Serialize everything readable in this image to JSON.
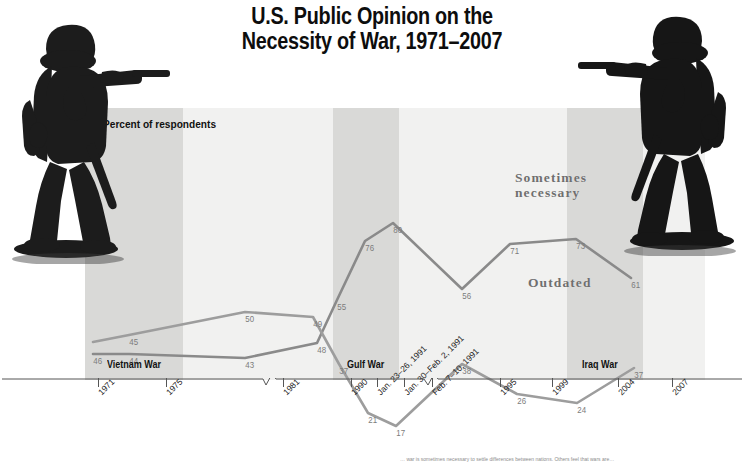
{
  "title": {
    "line1": "U.S. Public Opinion on the",
    "line2": "Necessity of War, 1971–2007"
  },
  "axis_label": "Percent of respondents",
  "war_bands": [
    {
      "name": "Vietnam War",
      "label": "Vietnam War"
    },
    {
      "name": "Gulf War",
      "label": "Gulf War"
    },
    {
      "name": "Iraq War",
      "label": "Iraq War"
    }
  ],
  "series_names": {
    "sometimes": "Sometimes\nnecessary",
    "sometimes_line1": "Sometimes",
    "sometimes_line2": "necessary",
    "outdated": "Outdated"
  },
  "caption": "… war is sometimes necessary to settle differences between nations. Others feel that wars are…",
  "colors": {
    "line_sometimes": "#8a8a8a",
    "line_outdated": "#9a9a9a",
    "band_light": "#f1f1f0",
    "band_dark": "#d9d9d7",
    "label_text": "#7c7c7c",
    "title": "#0d0d0d",
    "soldier": "#1b1b1b"
  },
  "chart_data": {
    "type": "line",
    "title": "U.S. Public Opinion on the Necessity of War, 1971–2007",
    "xlabel": "",
    "ylabel": "Percent of respondents",
    "ylim": [
      0,
      100
    ],
    "grid": false,
    "legend": "inline-annotations",
    "categories": [
      "1971",
      "1975",
      "1981",
      "1990",
      "Jan. 23–26, 1991",
      "Jan. 30–Feb. 2, 1991",
      "Feb. 7–10, 1991",
      "1995",
      "1999",
      "2004",
      "2007"
    ],
    "series": [
      {
        "name": "Sometimes necessary",
        "values": [
          46,
          44,
          43,
          48,
          55,
          76,
          80,
          56,
          71,
          73,
          61
        ]
      },
      {
        "name": "Outdated",
        "values": [
          null,
          45,
          50,
          49,
          37,
          21,
          17,
          38,
          26,
          24,
          37
        ]
      }
    ],
    "annotations": [
      {
        "text": "Vietnam War",
        "span": [
          "1971",
          "1975"
        ]
      },
      {
        "text": "Gulf War",
        "span": [
          "Jan. 23–26, 1991",
          "Feb. 7–10, 1991"
        ]
      },
      {
        "text": "Iraq War",
        "span": [
          "2004",
          "2007"
        ]
      }
    ],
    "axis_breaks": 2
  },
  "points": {
    "sometimes": [
      {
        "v": "46",
        "x": 8,
        "y": 248
      },
      {
        "v": "44",
        "x": 44,
        "y": 248
      },
      {
        "v": "43",
        "x": 160,
        "y": 252
      },
      {
        "v": "48",
        "x": 232,
        "y": 237
      },
      {
        "v": "55",
        "x": 252,
        "y": 194
      },
      {
        "v": "76",
        "x": 280,
        "y": 135
      },
      {
        "v": "80",
        "x": 308,
        "y": 117
      },
      {
        "v": "56",
        "x": 377,
        "y": 183
      },
      {
        "v": "71",
        "x": 425,
        "y": 138
      },
      {
        "v": "73",
        "x": 491,
        "y": 133
      },
      {
        "v": "61",
        "x": 546,
        "y": 172
      }
    ],
    "outdated": [
      {
        "v": "45",
        "x": 44,
        "y": 229
      },
      {
        "v": "50",
        "x": 160,
        "y": 206
      },
      {
        "v": "49",
        "x": 228,
        "y": 211
      },
      {
        "v": "37",
        "x": 254,
        "y": 258
      },
      {
        "v": "21",
        "x": 283,
        "y": 307
      },
      {
        "v": "17",
        "x": 311,
        "y": 320
      },
      {
        "v": "38",
        "x": 377,
        "y": 258
      },
      {
        "v": "26",
        "x": 432,
        "y": 288
      },
      {
        "v": "24",
        "x": 492,
        "y": 297
      },
      {
        "v": "37",
        "x": 549,
        "y": 262
      }
    ]
  },
  "ticks": [
    {
      "label": "1971",
      "x": 98
    },
    {
      "label": "1975",
      "x": 166
    },
    {
      "label": "1981",
      "x": 283
    },
    {
      "label": "1990",
      "x": 351
    },
    {
      "label": "Jan. 23–26, 1991",
      "x": 377
    },
    {
      "label": "Jan. 30–Feb. 2, 1991",
      "x": 404
    },
    {
      "label": "Feb. 7–10, 1991",
      "x": 432
    },
    {
      "label": "1995",
      "x": 500
    },
    {
      "label": "1999",
      "x": 552
    },
    {
      "label": "2004",
      "x": 618
    },
    {
      "label": "2007",
      "x": 672
    }
  ]
}
